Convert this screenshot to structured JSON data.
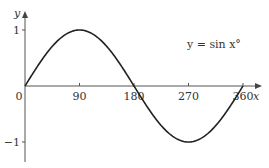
{
  "chart_data": {
    "type": "line",
    "title": "",
    "equation_label": "y = sin x°",
    "xlabel": "x",
    "ylabel": "y",
    "x_ticks": [
      0,
      90,
      180,
      270,
      360
    ],
    "x_tick_labels": [
      "0",
      "90",
      "180",
      "270",
      "360"
    ],
    "y_ticks": [
      1,
      -1
    ],
    "y_tick_labels": [
      "1",
      "−1"
    ],
    "xlim": [
      0,
      360
    ],
    "ylim": [
      -1,
      1
    ],
    "grid": false,
    "series": [
      {
        "name": "y = sin x°",
        "x": [
          0,
          30,
          60,
          90,
          120,
          150,
          180,
          210,
          240,
          270,
          300,
          330,
          360
        ],
        "values": [
          0,
          0.5,
          0.866,
          1,
          0.866,
          0.5,
          0,
          -0.5,
          -0.866,
          -1,
          -0.866,
          -0.5,
          0
        ]
      }
    ],
    "colors": {
      "curve": "#222222",
      "axes": "#555555"
    }
  }
}
